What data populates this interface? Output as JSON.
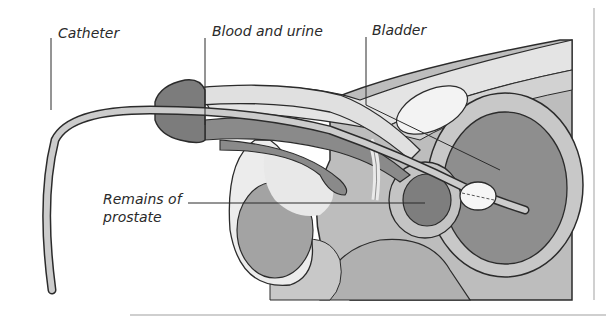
{
  "diagram": {
    "type": "anatomical cross-section",
    "labels": {
      "catheter": "Catheter",
      "blood_and_urine": "Blood and urine",
      "bladder": "Bladder",
      "remains_of_prostate_line1": "Remains of",
      "remains_of_prostate_line2": "prostate"
    },
    "colors": {
      "background": "#ffffff",
      "outline": "#2b2b2b",
      "light_tissue": "#e2e2e2",
      "mid_tissue": "#bdbdbd",
      "dark_tissue": "#8e8e8e",
      "darker_tissue": "#7a7a7a",
      "balloon": "#f4f4f4",
      "text": "#2a2a2a"
    }
  }
}
